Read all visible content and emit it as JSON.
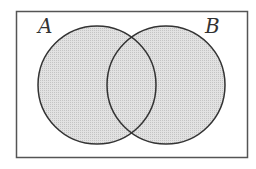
{
  "diagram": {
    "type": "venn",
    "universe": {
      "x": 16,
      "y": 11,
      "width": 232,
      "height": 147,
      "stroke": "#555555"
    },
    "sets": [
      {
        "label": "A",
        "cx": 97,
        "cy": 85,
        "r": 59,
        "label_x": 38,
        "label_y": 33
      },
      {
        "label": "B",
        "cx": 166,
        "cy": 85,
        "r": 59,
        "label_x": 205,
        "label_y": 33
      }
    ],
    "fill_color": "#d9d9d9",
    "stroke_color": "#333333",
    "shaded_region": "A ∪ B"
  }
}
